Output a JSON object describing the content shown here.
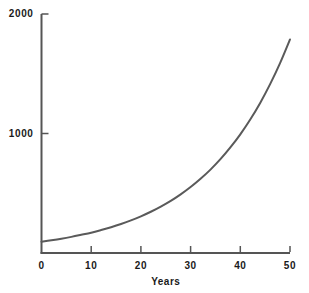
{
  "chart_data": {
    "type": "line",
    "title": "",
    "subtitle": "",
    "xlabel": "Years",
    "ylabel": "",
    "xlim": [
      0,
      50
    ],
    "ylim": [
      0,
      2000
    ],
    "grid": false,
    "legend": false,
    "legend_position": "none",
    "x_ticks": [
      {
        "value": 0,
        "label": "0"
      },
      {
        "value": 10,
        "label": "10"
      },
      {
        "value": 20,
        "label": "20"
      },
      {
        "value": 30,
        "label": "30"
      },
      {
        "value": 40,
        "label": "40"
      },
      {
        "value": 50,
        "label": "50"
      }
    ],
    "y_ticks": [
      {
        "value": 1000,
        "label": "1000"
      },
      {
        "value": 2000,
        "label": "2000"
      }
    ],
    "series": [
      {
        "name": "growth",
        "color": "#5a5a5a",
        "line_width": 2,
        "x": [
          0,
          2,
          4,
          6,
          8,
          10,
          12,
          14,
          16,
          18,
          20,
          22,
          24,
          26,
          28,
          30,
          32,
          34,
          36,
          38,
          40,
          42,
          44,
          46,
          48,
          50
        ],
        "values": [
          95,
          107,
          120,
          135,
          152,
          170,
          192,
          216,
          243,
          273,
          307,
          345,
          388,
          436,
          491,
          552,
          621,
          698,
          785,
          883,
          993,
          1117,
          1256,
          1413,
          1589,
          1787
        ]
      }
    ],
    "annotations": []
  },
  "axes": {
    "x_axis_name": "x-axis",
    "y_axis_name": "y-axis",
    "axis_color": "#555555"
  }
}
